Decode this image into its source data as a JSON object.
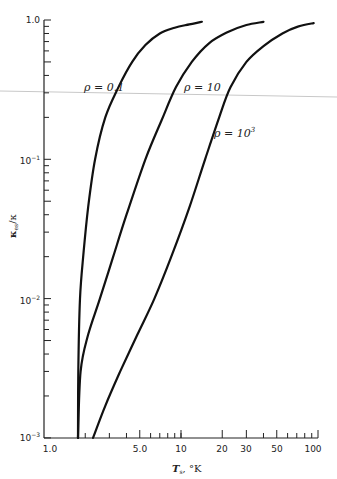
{
  "chart_data": {
    "type": "line",
    "title": "",
    "xlabel": "T_s, °K",
    "ylabel": "κ_es / κ",
    "xscale": "log",
    "yscale": "log",
    "xlim": [
      1.0,
      100
    ],
    "ylim": [
      0.001,
      1.0
    ],
    "grid": false,
    "legend": "inline labels",
    "x_tick_labels": [
      "1.0",
      "5.0",
      "10",
      "20",
      "30",
      "50",
      "100"
    ],
    "x_tick_values": [
      1,
      5,
      10,
      20,
      30,
      50,
      100
    ],
    "y_tick_labels": [
      "1.0",
      "10⁻¹",
      "10⁻²",
      "10⁻³"
    ],
    "y_tick_values": [
      1.0,
      0.1,
      0.01,
      0.001
    ],
    "series": [
      {
        "name": "ρ = 0.1",
        "x": [
          1.77,
          1.78,
          1.83,
          1.95,
          2.1,
          2.36,
          2.8,
          3.5,
          4.4,
          5.5,
          7.0,
          9.0,
          11.5,
          14.2
        ],
        "y": [
          0.001,
          0.003,
          0.01,
          0.022,
          0.045,
          0.1,
          0.2,
          0.33,
          0.5,
          0.66,
          0.8,
          0.88,
          0.93,
          0.97
        ]
      },
      {
        "name": "ρ = 10",
        "x": [
          1.77,
          1.85,
          2.1,
          2.56,
          3.2,
          4.0,
          5.5,
          7.2,
          9.2,
          12.0,
          16.0,
          22.0,
          30.0,
          40.0
        ],
        "y": [
          0.001,
          0.003,
          0.0055,
          0.01,
          0.02,
          0.04,
          0.1,
          0.19,
          0.33,
          0.5,
          0.68,
          0.82,
          0.92,
          0.97
        ]
      },
      {
        "name": "ρ = 10³",
        "x": [
          2.28,
          2.8,
          3.6,
          4.8,
          6.4,
          8.5,
          11.5,
          15.0,
          19.0,
          23.0,
          30.0,
          40.0,
          55.0,
          72.0,
          93.0
        ],
        "y": [
          0.001,
          0.0017,
          0.003,
          0.0055,
          0.01,
          0.02,
          0.045,
          0.1,
          0.2,
          0.33,
          0.5,
          0.65,
          0.8,
          0.9,
          0.95
        ]
      }
    ],
    "annotations": [
      {
        "text": "ρ = 0.1",
        "x": 2.2,
        "y": 0.33
      },
      {
        "text": "ρ = 10",
        "x": 10.0,
        "y": 0.33
      },
      {
        "text": "ρ = 10³",
        "x": 20.0,
        "y": 0.2
      }
    ]
  },
  "labels": {
    "curve_rho_01": "ρ = 0.1",
    "curve_rho_10": "ρ = 10",
    "curve_rho_1000_base": "ρ = 10",
    "curve_rho_1000_exp": "3",
    "x_title_main": "T",
    "x_title_sub": "s",
    "x_title_unit": ", °K",
    "y_title_main": "κ",
    "y_title_sub": "es",
    "y_title_rest": "/κ",
    "y_tick_1": "1.0",
    "y_tick_01_base": "10",
    "y_tick_01_exp": "−1",
    "y_tick_001_base": "10",
    "y_tick_001_exp": "−2",
    "y_tick_0001_base": "10",
    "y_tick_0001_exp": "−3",
    "x_tick_1": "1.0",
    "x_tick_5": "5.0",
    "x_tick_10": "10",
    "x_tick_20": "20",
    "x_tick_30": "30",
    "x_tick_50": "50",
    "x_tick_100": "100"
  },
  "colors": {
    "curve": "#111111",
    "axis": "#222222",
    "scan_line": "#c8c8c8"
  }
}
